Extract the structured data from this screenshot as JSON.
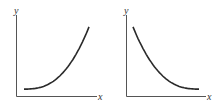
{
  "chart_data": [
    {
      "type": "line",
      "title": "",
      "xlabel": "x",
      "ylabel": "y",
      "shape": "increasing-convex (exponential growth)",
      "series": [
        {
          "name": "growth",
          "x": [
            0,
            0.2,
            0.4,
            0.6,
            0.8,
            1.0
          ],
          "values": [
            0.1,
            0.13,
            0.2,
            0.33,
            0.57,
            1.0
          ]
        }
      ],
      "xlim": [
        0,
        1
      ],
      "ylim": [
        0,
        1.1
      ],
      "grid": false
    },
    {
      "type": "line",
      "title": "",
      "xlabel": "x",
      "ylabel": "y",
      "shape": "decreasing-convex (exponential decay)",
      "series": [
        {
          "name": "decay",
          "x": [
            0,
            0.2,
            0.4,
            0.6,
            0.8,
            1.0
          ],
          "values": [
            1.0,
            0.55,
            0.31,
            0.19,
            0.13,
            0.1
          ]
        }
      ],
      "xlim": [
        0,
        1
      ],
      "ylim": [
        0,
        1.1
      ],
      "grid": false
    }
  ]
}
